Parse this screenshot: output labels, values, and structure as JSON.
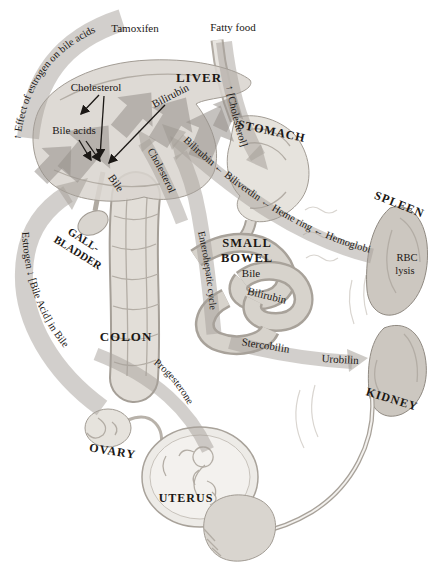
{
  "figure": {
    "type": "medical-pathway-diagram"
  },
  "colors": {
    "background": "#ffffff",
    "text": "#1b1815",
    "arrow_band": "#a5a099",
    "organ_light": "#e6e3dd",
    "organ_dark": "#ccc7c0",
    "outline": "#9a948c"
  },
  "labels": {
    "tamoxifen": "Tamoxifen",
    "fatty_food": "Fatty food",
    "estrogen_effect": "↑ Effect of estrogen on bile acids",
    "liver": "LIVER",
    "cholesterol": "Cholesterol",
    "bilirubin": "Bilirubin",
    "bile_acids": "Bile acids",
    "bile": "Bile",
    "cholesterol_intake": "↑ [Cholesterol]",
    "stomach": "STOMACH",
    "heme_pathway": "Bilirubin ← Biliverdin ← Heme ring ← Hemoglobin",
    "spleen": "SPLEEN",
    "rbc_lysis_line1": "RBC",
    "rbc_lysis_line2": "lysis",
    "cholesterol_absorption": "Cholesterol",
    "enterohepatic_cycle": "Enterohepatic cycle",
    "small_bowel_line1": "SMALL",
    "small_bowel_line2": "BOWEL",
    "bile_bowel": "Bile",
    "bilirubin_bowel": "Bilirubin",
    "stercobilin": "Stercobilin",
    "urobilin": "Urobilin",
    "kidney": "KIDNEY",
    "gallbladder_line1": "GALL-",
    "gallbladder_line2": "BLADDER",
    "estrogen_bile_acid": "Estrogen ↓ [Bile Acid] in Bile",
    "colon": "COLON",
    "progesterone": "Progesterone",
    "ovary": "OVARY",
    "uterus": "UTERUS"
  }
}
